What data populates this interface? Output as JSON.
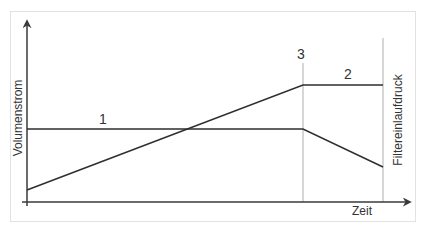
{
  "diagram": {
    "title": "",
    "axes": {
      "y_label": "Volumenstrom",
      "x_label": "Zeit"
    },
    "markers": {
      "vertical_3_label": "3",
      "vertical_right_label": "Filtereinlaufdruck"
    },
    "curves": [
      {
        "id": "1",
        "label": "1",
        "description": "constant then decreasing"
      },
      {
        "id": "2",
        "label": "2",
        "description": "increasing then constant"
      }
    ],
    "colors": {
      "frame": "#e2e2e2",
      "axis": "#3a3a3a",
      "curve": "#2e2e2e",
      "guide": "#bdbdbd",
      "text": "#333333"
    }
  }
}
